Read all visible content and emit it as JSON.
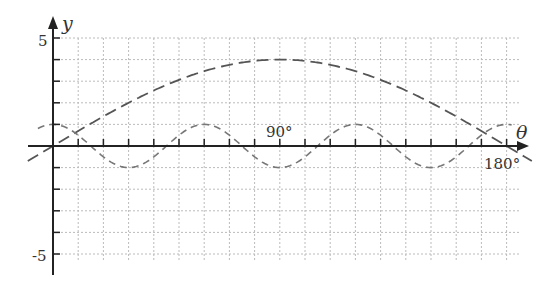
{
  "chart_data": {
    "type": "line",
    "title": "",
    "xlabel": "θ",
    "ylabel": "y",
    "x_unit": "degrees",
    "xlim": [
      -10,
      190
    ],
    "ylim": [
      -5,
      5
    ],
    "grid": true,
    "x_ticks_every": 10,
    "y_ticks_every": 1,
    "x_tick_labels": [
      {
        "value": 90,
        "label": "90°"
      },
      {
        "value": 180,
        "label": "180°"
      }
    ],
    "y_tick_labels": [
      {
        "value": 5,
        "label": "5"
      },
      {
        "value": -5,
        "label": "-5"
      }
    ],
    "series": [
      {
        "name": "y = 4 sin θ",
        "style": "long-dash",
        "color": "#555555",
        "x": [
          -10,
          0,
          15,
          30,
          45,
          60,
          75,
          90,
          105,
          120,
          135,
          150,
          165,
          180,
          190
        ],
        "values": [
          -0.69,
          0,
          1.04,
          2.0,
          2.83,
          3.46,
          3.86,
          4.0,
          3.86,
          3.46,
          2.83,
          2.0,
          1.04,
          0,
          -0.69
        ]
      },
      {
        "name": "y = cos 6θ",
        "style": "short-dash",
        "color": "#777777",
        "x": [
          -5,
          0,
          15,
          30,
          45,
          60,
          75,
          90,
          105,
          120,
          135,
          150,
          165,
          180
        ],
        "values": [
          0.87,
          1,
          0,
          -1,
          0,
          1,
          0,
          -1,
          0,
          1,
          0,
          -1,
          0,
          1
        ]
      }
    ]
  }
}
